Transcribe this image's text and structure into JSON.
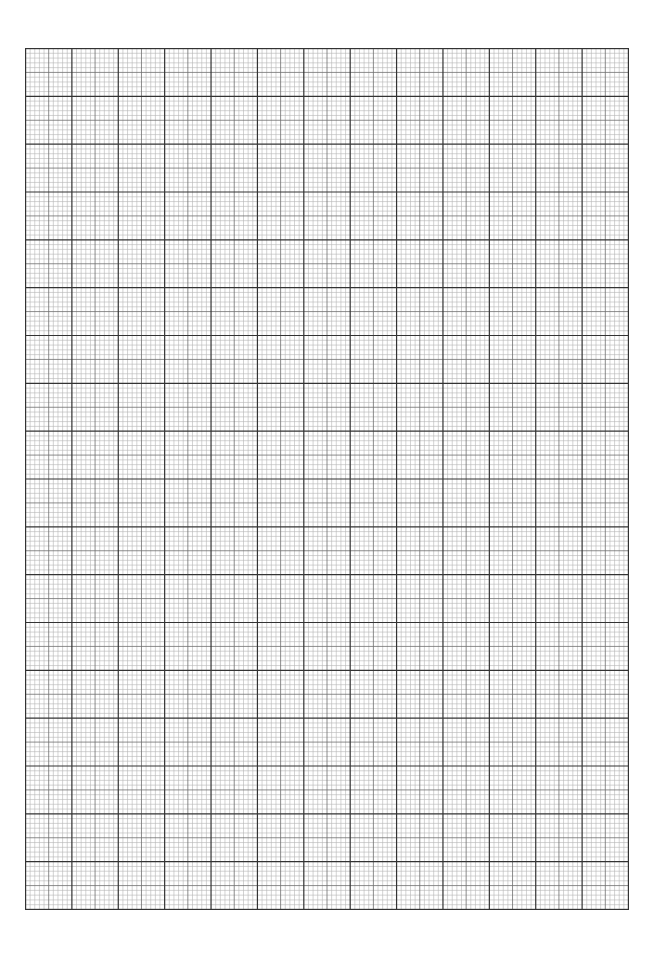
{
  "document": {
    "type": "graph paper",
    "background_color": "#ffffff",
    "grid": {
      "columns": 13,
      "rows": 18,
      "subdivisions_per_cell": 10,
      "half_line": true,
      "major_line_color": "#333333",
      "half_line_color": "#6e6e6e",
      "minor_line_color": "#b5b5b5"
    }
  }
}
